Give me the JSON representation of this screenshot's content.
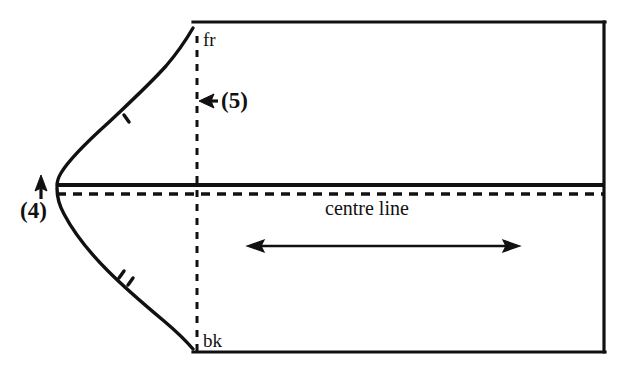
{
  "figure": {
    "kind": "sleeve-cap-pattern-diagram",
    "background_color": "#ffffff",
    "ink_color": "#111111",
    "width": 636,
    "height": 383
  },
  "labels": {
    "front_notch": "fr",
    "back_notch": "bk",
    "centre_line": "centre line",
    "callout_4": "(4)",
    "callout_5": "(5)"
  },
  "geometry": {
    "panel": {
      "top_edge_y": 22,
      "bottom_edge_y": 352,
      "right_edge_x": 605,
      "left_edge_x": 193
    },
    "centre_line": {
      "solid_y": 185,
      "dashed_y": 194,
      "x_start": 57,
      "x_end": 605
    },
    "vertical_dashed_line": {
      "x": 197,
      "y_top": 38,
      "y_bottom": 350
    },
    "cap_curve": {
      "apex_x": 57,
      "apex_y": 187,
      "front_point": [
        193,
        30
      ],
      "back_point": [
        193,
        348
      ]
    },
    "width_arrow": {
      "y": 246,
      "x_left": 248,
      "x_right": 519,
      "heads": "both"
    },
    "callout_4_arrow": {
      "x": 41,
      "y_tip": 178,
      "y_tail": 199,
      "direction": "up"
    },
    "callout_5_arrow": {
      "y": 101,
      "x_tip": 200,
      "x_tail": 219,
      "direction": "left"
    },
    "notches": {
      "upper_count": 1,
      "lower_count": 2
    }
  }
}
